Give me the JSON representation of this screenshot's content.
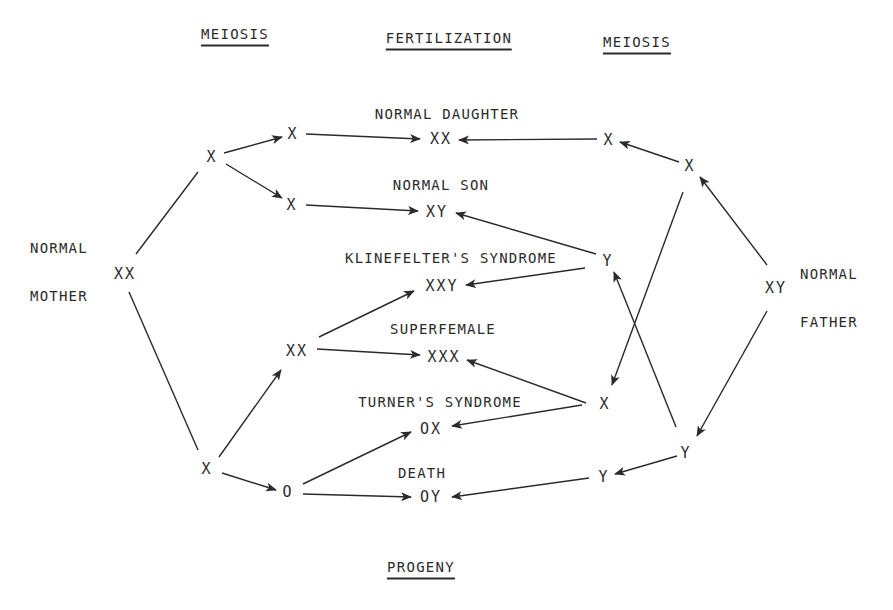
{
  "headers": [
    {
      "id": "meiosis-left",
      "text": "MEIOSIS",
      "x": 235,
      "y": 36
    },
    {
      "id": "fertilization",
      "text": "FERTILIZATION",
      "x": 449,
      "y": 40
    },
    {
      "id": "meiosis-right",
      "text": "MEIOSIS",
      "x": 637,
      "y": 44
    },
    {
      "id": "progeny",
      "text": "PROGENY",
      "x": 421,
      "y": 569
    }
  ],
  "parents": [
    {
      "id": "mother",
      "line1": "NORMAL",
      "line2": "MOTHER",
      "genotype": "XX",
      "label_x": 30,
      "label_y": 272,
      "geno_x": 125,
      "geno_y": 274
    },
    {
      "id": "father",
      "line1": "NORMAL",
      "line2": "FATHER",
      "genotype": "XY",
      "label_x": 800,
      "label_y": 298,
      "geno_x": 776,
      "geno_y": 288
    }
  ],
  "gametes": [
    {
      "id": "m-x-top",
      "text": "X",
      "x": 212,
      "y": 157
    },
    {
      "id": "m-x-a",
      "text": "X",
      "x": 293,
      "y": 134
    },
    {
      "id": "m-x-b",
      "text": "X",
      "x": 292,
      "y": 205
    },
    {
      "id": "m-x-bottom",
      "text": "X",
      "x": 207,
      "y": 469
    },
    {
      "id": "m-xx",
      "text": "XX",
      "x": 297,
      "y": 351
    },
    {
      "id": "m-o",
      "text": "O",
      "x": 288,
      "y": 492
    },
    {
      "id": "f-x-top",
      "text": "X",
      "x": 690,
      "y": 166
    },
    {
      "id": "f-x-a",
      "text": "X",
      "x": 609,
      "y": 140
    },
    {
      "id": "f-y-a",
      "text": "Y",
      "x": 608,
      "y": 261
    },
    {
      "id": "f-x-b",
      "text": "X",
      "x": 605,
      "y": 404
    },
    {
      "id": "f-y-bottom",
      "text": "Y",
      "x": 686,
      "y": 453
    },
    {
      "id": "f-y-b",
      "text": "Y",
      "x": 604,
      "y": 477
    }
  ],
  "progeny": [
    {
      "id": "normal-daughter",
      "name": "NORMAL DAUGHTER",
      "genotype": "XX",
      "name_x": 447,
      "name_y": 114,
      "geno_x": 441,
      "geno_y": 139
    },
    {
      "id": "normal-son",
      "name": "NORMAL SON",
      "genotype": "XY",
      "name_x": 441,
      "name_y": 185,
      "geno_x": 437,
      "geno_y": 212
    },
    {
      "id": "klinefelter",
      "name": "KLINEFELTER'S SYNDROME",
      "genotype": "XXY",
      "name_x": 451,
      "name_y": 258,
      "geno_x": 442,
      "geno_y": 286
    },
    {
      "id": "superfemale",
      "name": "SUPERFEMALE",
      "genotype": "XXX",
      "name_x": 443,
      "name_y": 329,
      "geno_x": 444,
      "geno_y": 357
    },
    {
      "id": "turner",
      "name": "TURNER'S SYNDROME",
      "genotype": "OX",
      "name_x": 440,
      "name_y": 402,
      "geno_x": 431,
      "geno_y": 429
    },
    {
      "id": "death",
      "name": "DEATH",
      "genotype": "OY",
      "name_x": 422,
      "name_y": 473,
      "geno_x": 431,
      "geno_y": 497
    }
  ],
  "edges": [
    {
      "from": "mother",
      "to": "m-x-top",
      "x1": 136,
      "y1": 254,
      "x2": 198,
      "y2": 172,
      "arrow": false
    },
    {
      "from": "mother",
      "to": "m-x-bottom",
      "x1": 129,
      "y1": 292,
      "x2": 198,
      "y2": 450,
      "arrow": false
    },
    {
      "from": "m-x-top",
      "to": "m-x-a",
      "x1": 224,
      "y1": 153,
      "x2": 282,
      "y2": 137,
      "arrow": true
    },
    {
      "from": "m-x-top",
      "to": "m-x-b",
      "x1": 226,
      "y1": 164,
      "x2": 282,
      "y2": 198,
      "arrow": true
    },
    {
      "from": "m-x-a",
      "to": "normal-daughter",
      "x1": 306,
      "y1": 134,
      "x2": 420,
      "y2": 139,
      "arrow": true
    },
    {
      "from": "m-x-b",
      "to": "normal-son",
      "x1": 306,
      "y1": 205,
      "x2": 418,
      "y2": 211,
      "arrow": true
    },
    {
      "from": "m-x-bottom",
      "to": "m-xx",
      "x1": 219,
      "y1": 457,
      "x2": 281,
      "y2": 370,
      "arrow": true
    },
    {
      "from": "m-x-bottom",
      "to": "m-o",
      "x1": 222,
      "y1": 473,
      "x2": 276,
      "y2": 490,
      "arrow": true
    },
    {
      "from": "m-xx",
      "to": "klinefelter",
      "x1": 319,
      "y1": 337,
      "x2": 414,
      "y2": 291,
      "arrow": true
    },
    {
      "from": "m-xx",
      "to": "superfemale",
      "x1": 317,
      "y1": 349,
      "x2": 420,
      "y2": 355,
      "arrow": true
    },
    {
      "from": "m-o",
      "to": "turner",
      "x1": 303,
      "y1": 484,
      "x2": 411,
      "y2": 432,
      "arrow": true
    },
    {
      "from": "m-o",
      "to": "death",
      "x1": 303,
      "y1": 494,
      "x2": 411,
      "y2": 497,
      "arrow": true
    },
    {
      "from": "father",
      "to": "f-x-top",
      "x1": 767,
      "y1": 265,
      "x2": 700,
      "y2": 177,
      "arrow": true
    },
    {
      "from": "father",
      "to": "f-y-bottom",
      "x1": 767,
      "y1": 311,
      "x2": 697,
      "y2": 436,
      "arrow": true
    },
    {
      "from": "f-x-top",
      "to": "f-x-a",
      "x1": 679,
      "y1": 162,
      "x2": 620,
      "y2": 142,
      "arrow": true
    },
    {
      "from": "f-x-top",
      "to": "f-x-b",
      "x1": 683,
      "y1": 192,
      "x2": 612,
      "y2": 385,
      "arrow": true
    },
    {
      "from": "f-y-bottom",
      "to": "f-y-a",
      "x1": 676,
      "y1": 427,
      "x2": 614,
      "y2": 272,
      "arrow": true
    },
    {
      "from": "f-y-bottom",
      "to": "f-y-b",
      "x1": 677,
      "y1": 456,
      "x2": 615,
      "y2": 474,
      "arrow": true
    },
    {
      "from": "f-x-a",
      "to": "normal-daughter",
      "x1": 597,
      "y1": 139,
      "x2": 459,
      "y2": 140,
      "arrow": true
    },
    {
      "from": "f-y-a",
      "to": "normal-son",
      "x1": 596,
      "y1": 254,
      "x2": 456,
      "y2": 213,
      "arrow": true
    },
    {
      "from": "f-y-a",
      "to": "klinefelter",
      "x1": 585,
      "y1": 268,
      "x2": 466,
      "y2": 285,
      "arrow": true
    },
    {
      "from": "f-x-b",
      "to": "superfemale",
      "x1": 586,
      "y1": 403,
      "x2": 467,
      "y2": 360,
      "arrow": true
    },
    {
      "from": "f-x-b",
      "to": "turner",
      "x1": 582,
      "y1": 405,
      "x2": 452,
      "y2": 426,
      "arrow": true
    },
    {
      "from": "f-y-b",
      "to": "death",
      "x1": 589,
      "y1": 478,
      "x2": 452,
      "y2": 497,
      "arrow": true
    }
  ],
  "style": {
    "ink": "#2b2b2b",
    "background": "#ffffff"
  }
}
